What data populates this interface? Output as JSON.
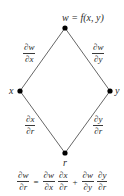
{
  "diagram": {
    "type": "tree-diagram",
    "nodes": {
      "top": {
        "label": "w = f(x, y)",
        "x": 65,
        "y": 28
      },
      "left": {
        "label": "x",
        "x": 20,
        "y": 91
      },
      "right": {
        "label": "y",
        "x": 110,
        "y": 91
      },
      "bottom": {
        "label": "r",
        "x": 65,
        "y": 153
      }
    },
    "edges": [
      {
        "from": "top",
        "to": "left",
        "label": {
          "num": "∂w",
          "den": "∂x"
        }
      },
      {
        "from": "top",
        "to": "right",
        "label": {
          "num": "∂w",
          "den": "∂y"
        }
      },
      {
        "from": "left",
        "to": "bottom",
        "label": {
          "num": "∂x",
          "den": "∂r"
        }
      },
      {
        "from": "right",
        "to": "bottom",
        "label": {
          "num": "∂y",
          "den": "∂r"
        }
      }
    ],
    "equation": {
      "lhs": {
        "num": "∂w",
        "den": "∂r"
      },
      "equals": "=",
      "term1": [
        {
          "num": "∂w",
          "den": "∂x"
        },
        {
          "num": "∂x",
          "den": "∂r"
        }
      ],
      "plus": "+",
      "term2": [
        {
          "num": "∂w",
          "den": "∂y"
        },
        {
          "num": "∂y",
          "den": "∂r"
        }
      ]
    },
    "colors": {
      "line": "#555555",
      "node": "#000000",
      "text": "#2a2a2a",
      "background": "#ffffff"
    }
  }
}
